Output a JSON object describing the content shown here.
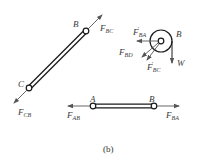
{
  "figure": {
    "caption": "(b)",
    "colors": {
      "member": "#1a1a1a",
      "force": "#555555",
      "text": "#3a3a3a"
    }
  },
  "member_cb": {
    "end_b_label": "B",
    "end_c_label": "C",
    "force_at_b": {
      "main": "F",
      "sub": "BC"
    },
    "force_at_c": {
      "main": "F",
      "sub": "CB"
    }
  },
  "member_ab": {
    "end_a_label": "A",
    "end_b_label": "B",
    "force_at_a": {
      "main": "F",
      "sub": "AB"
    },
    "force_at_b": {
      "main": "F",
      "sub": "BA"
    }
  },
  "pulley_b": {
    "label": "B",
    "forces": [
      {
        "main": "F",
        "prime": "'",
        "sub": "BA"
      },
      {
        "main": "F",
        "sub": "BD"
      },
      {
        "main": "F",
        "prime": "'",
        "sub": "BC"
      },
      {
        "main": "W"
      }
    ]
  }
}
